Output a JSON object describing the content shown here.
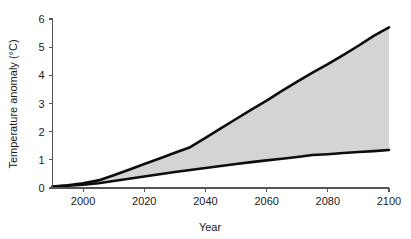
{
  "chart_data": {
    "type": "area",
    "title": "",
    "subtitle": "",
    "xlabel": "Year",
    "ylabel": "Temperature anomaly (°C)",
    "xlim": [
      1990,
      2100
    ],
    "ylim": [
      0,
      6
    ],
    "grid": false,
    "legend": null,
    "xticks": [
      2000,
      2020,
      2040,
      2060,
      2080,
      2100
    ],
    "xtick_labels": [
      "2000",
      "2020",
      "2040",
      "2060",
      "2080",
      "2100"
    ],
    "yticks": [
      0,
      1,
      2,
      3,
      4,
      5,
      6
    ],
    "ytick_labels": [
      "0",
      "1",
      "2",
      "3",
      "4",
      "5",
      "6"
    ],
    "band_fill_color": "#d4d4d4",
    "line_color": "#0d0d0d",
    "annotations": [],
    "x": [
      1990,
      1995,
      2000,
      2005,
      2010,
      2015,
      2020,
      2025,
      2030,
      2035,
      2040,
      2045,
      2050,
      2055,
      2060,
      2065,
      2070,
      2075,
      2080,
      2085,
      2090,
      2095,
      2100
    ],
    "series": [
      {
        "name": "Upper bound",
        "values": [
          0.05,
          0.1,
          0.17,
          0.27,
          0.45,
          0.65,
          0.85,
          1.05,
          1.25,
          1.45,
          1.78,
          2.12,
          2.45,
          2.78,
          3.1,
          3.45,
          3.78,
          4.1,
          4.4,
          4.72,
          5.05,
          5.4,
          5.7
        ]
      },
      {
        "name": "Lower bound",
        "values": [
          0.05,
          0.08,
          0.12,
          0.17,
          0.25,
          0.33,
          0.41,
          0.49,
          0.57,
          0.64,
          0.71,
          0.78,
          0.85,
          0.92,
          0.98,
          1.04,
          1.1,
          1.17,
          1.2,
          1.24,
          1.28,
          1.31,
          1.35
        ]
      }
    ]
  },
  "axes": {
    "y_axis_title": "Temperature anomaly (°C)",
    "x_axis_title": "Year"
  }
}
